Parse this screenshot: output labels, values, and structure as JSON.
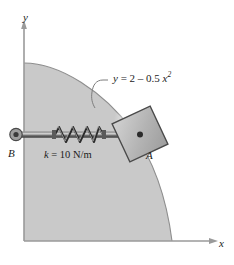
{
  "figure": {
    "type": "mechanics-diagram",
    "axes": {
      "x_label": "x",
      "y_label": "y"
    },
    "curve": {
      "equation_text": "y = 2 – 0.5 x",
      "equation_prefix": "y",
      "equation_body": " = 2 – 0.5 ",
      "equation_var": "x",
      "equation_exponent": "2",
      "full": "y = 2 – 0.5 x²"
    },
    "spring": {
      "stiffness_label_k": "k",
      "stiffness_label_rest": " = 10 N/m",
      "stiffness_full": "k = 10 N/m",
      "coils": 6
    },
    "points": {
      "anchor": "B",
      "block": "A"
    },
    "colors": {
      "region_fill": "#c9c9c9",
      "region_edge": "#8e8e8e",
      "axis": "#9a9a9a",
      "rod": "#6e6e6e",
      "block_fill": "#b5b5b5",
      "block_edge": "#4a4a4a",
      "text": "#1b1b1b",
      "background": "#ffffff"
    }
  }
}
